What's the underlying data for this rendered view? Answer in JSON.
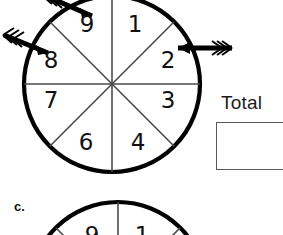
{
  "page": {
    "background_color": "#ffffff",
    "width": 283,
    "height": 235
  },
  "spinner": {
    "name": "eight-sector-spinner",
    "center_x": 112,
    "center_y": 84,
    "radius": 88,
    "outline_color": "#000000",
    "spoke_color": "#4a4a4a",
    "sector_count": 8,
    "sectors": [
      {
        "label": "1",
        "x": 135,
        "y": 25
      },
      {
        "label": "2",
        "x": 168,
        "y": 61
      },
      {
        "label": "3",
        "x": 168,
        "y": 101
      },
      {
        "label": "4",
        "x": 138,
        "y": 143
      },
      {
        "label": "6",
        "x": 86,
        "y": 143
      },
      {
        "label": "7",
        "x": 51,
        "y": 101
      },
      {
        "label": "8",
        "x": 51,
        "y": 61
      },
      {
        "label": "9",
        "x": 87,
        "y": 25
      }
    ],
    "arrows": [
      {
        "name": "arrow-top-left",
        "direction": "down-right",
        "tail_x": 44,
        "tail_y": -6,
        "tip_x": 92,
        "tip_y": 15,
        "color": "#000000"
      },
      {
        "name": "arrow-left",
        "direction": "right",
        "tail_x": 2,
        "tail_y": 36,
        "tip_x": 46,
        "tip_y": 52,
        "color": "#000000"
      },
      {
        "name": "arrow-right",
        "direction": "left",
        "tail_x": 232,
        "tail_y": 48,
        "tip_x": 178,
        "tip_y": 48,
        "color": "#000000"
      }
    ]
  },
  "total": {
    "label": "Total",
    "answer_value": "",
    "box_border_color": "#5a5a5a"
  },
  "next_item": {
    "letter": "c.",
    "partial_spinner": {
      "center_x": 118,
      "center_y": 290,
      "radius": 88,
      "visible_numbers": [
        {
          "label": "9",
          "x": 92,
          "y": 232
        },
        {
          "label": "1",
          "x": 142,
          "y": 232
        }
      ]
    }
  }
}
